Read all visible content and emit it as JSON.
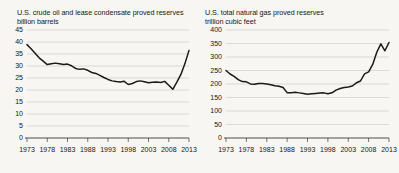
{
  "page": {
    "background_color": "#f7f6f2",
    "line_color": "#1a1a1a",
    "grid_color": "#c9c8c4"
  },
  "chart_data": [
    {
      "id": "crude-oil",
      "type": "line",
      "title": "U.S. crude oil and lease condensate proved reserves",
      "subtitle": "billion barrels",
      "xlabel": "",
      "ylabel": "billion barrels",
      "grid": true,
      "legend": "none",
      "xlim": [
        1973,
        2013
      ],
      "ylim": [
        0,
        45
      ],
      "yticks": [
        0,
        5,
        10,
        15,
        20,
        25,
        30,
        35,
        40,
        45
      ],
      "xticks": [
        1973,
        1978,
        1983,
        1988,
        1993,
        1998,
        2003,
        2008,
        2013
      ],
      "x": [
        1973,
        1974,
        1975,
        1976,
        1977,
        1978,
        1979,
        1980,
        1981,
        1982,
        1983,
        1984,
        1985,
        1986,
        1987,
        1988,
        1989,
        1990,
        1991,
        1992,
        1993,
        1994,
        1995,
        1996,
        1997,
        1998,
        1999,
        2000,
        2001,
        2002,
        2003,
        2004,
        2005,
        2006,
        2007,
        2008,
        2009,
        2010,
        2011,
        2012,
        2013
      ],
      "values": [
        38.9,
        37.2,
        35.3,
        33.4,
        32.0,
        30.6,
        30.9,
        31.2,
        30.9,
        30.6,
        30.8,
        30.1,
        29.0,
        28.6,
        28.8,
        28.2,
        27.3,
        26.9,
        26.1,
        25.2,
        24.4,
        23.8,
        23.5,
        23.3,
        23.6,
        22.3,
        22.7,
        23.5,
        23.8,
        23.4,
        23.0,
        23.2,
        23.3,
        23.1,
        23.6,
        22.0,
        20.3,
        23.3,
        26.5,
        31.0,
        36.5
      ]
    },
    {
      "id": "natural-gas",
      "type": "line",
      "title": "U.S. total natural gas proved reserves",
      "subtitle": "trillion cubic feet",
      "xlabel": "",
      "ylabel": "trillion cubic feet",
      "grid": true,
      "legend": "none",
      "xlim": [
        1973,
        2013
      ],
      "ylim": [
        0,
        400
      ],
      "yticks": [
        0,
        50,
        100,
        150,
        200,
        250,
        300,
        350,
        400
      ],
      "xticks": [
        1973,
        1978,
        1983,
        1988,
        1993,
        1998,
        2003,
        2008,
        2013
      ],
      "x": [
        1973,
        1974,
        1975,
        1976,
        1977,
        1978,
        1979,
        1980,
        1981,
        1982,
        1983,
        1984,
        1985,
        1986,
        1987,
        1988,
        1989,
        1990,
        1991,
        1992,
        1993,
        1994,
        1995,
        1996,
        1997,
        1998,
        1999,
        2000,
        2001,
        2002,
        2003,
        2004,
        2005,
        2006,
        2007,
        2008,
        2009,
        2010,
        2011,
        2012,
        2013
      ],
      "values": [
        249.9,
        237.1,
        228.2,
        216.0,
        208.9,
        208.0,
        200.3,
        199.0,
        201.7,
        201.5,
        200.2,
        197.5,
        193.4,
        191.6,
        187.2,
        168.0,
        168.0,
        169.3,
        167.1,
        165.0,
        162.4,
        163.8,
        165.1,
        166.5,
        167.2,
        164.0,
        167.4,
        177.4,
        183.5,
        186.9,
        189.0,
        192.5,
        204.4,
        211.1,
        237.7,
        244.7,
        272.5,
        317.6,
        348.8,
        323.0,
        353.7
      ]
    }
  ]
}
